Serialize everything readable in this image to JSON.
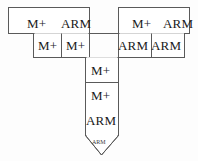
{
  "diagram": {
    "type": "flowchart-arrow",
    "title": "",
    "background_color": "#fdfdfd",
    "stroke_color": "#5a5a5a",
    "fill_color": "#ffffff",
    "text_color": "#1a1a1a",
    "shape_description": "T-shaped / downward-arrow pipeline outline composed of adjoining rectangular cells",
    "rows": [
      {
        "row_index": 0,
        "cells": [
          {
            "id": "r0c0",
            "label": "M+",
            "x": 12,
            "y": 13
          },
          {
            "id": "r0c1",
            "label": "ARM",
            "x": 62,
            "y": 13
          },
          {
            "id": "r0c2",
            "label": "M+",
            "x": 120,
            "y": 13
          },
          {
            "id": "r0c3",
            "label": "ARM",
            "x": 167,
            "y": 13
          }
        ]
      },
      {
        "row_index": 1,
        "cells": [
          {
            "id": "r1c0",
            "label": "M+",
            "x": 44,
            "y": 45
          },
          {
            "id": "r1c1",
            "label": "M+",
            "x": 78,
            "y": 45
          },
          {
            "id": "r1c2",
            "label": "ARM",
            "x": 122,
            "y": 45
          },
          {
            "id": "r1c3",
            "label": "ARM",
            "x": 155,
            "y": 45
          }
        ]
      },
      {
        "row_index": 2,
        "cells": [
          {
            "id": "r2c0",
            "label": "M+",
            "x": 101,
            "y": 70
          }
        ]
      },
      {
        "row_index": 3,
        "cells": [
          {
            "id": "r3c0",
            "label": "M+",
            "x": 101,
            "y": 96
          }
        ]
      },
      {
        "row_index": 4,
        "cells": [
          {
            "id": "r4c0",
            "label": "ARM",
            "x": 101,
            "y": 120
          }
        ]
      },
      {
        "row_index": 5,
        "cells": [
          {
            "id": "r5c0",
            "label": "ARM",
            "x": 101,
            "y": 143,
            "tiny": true
          }
        ]
      }
    ],
    "outline_path": "M 8 7 L 89 7 L 89 34 L 118 34 L 118 7 L 190 7 L 190 33 L 152 33 L 152 57 L 118 57 L 118 137 L 101 154 L 85 137 L 85 57 L 33 57 L 33 33 L 8 33 Z",
    "internal_dividers": [
      {
        "from_x": 85,
        "from_y": 82,
        "to_x": 118,
        "to_y": 82
      },
      {
        "from_x": 89,
        "from_y": 7,
        "to_x": 89,
        "to_y": 34
      },
      {
        "from_x": 118,
        "from_y": 7,
        "to_x": 118,
        "to_y": 34
      },
      {
        "from_x": 33,
        "from_y": 33,
        "to_x": 33,
        "to_y": 57
      },
      {
        "from_x": 152,
        "from_y": 33,
        "to_x": 152,
        "to_y": 57
      },
      {
        "from_x": 85,
        "from_y": 57,
        "to_x": 118,
        "to_y": 57
      },
      {
        "from_x": 8,
        "from_y": 33,
        "to_x": 89,
        "to_y": 33
      },
      {
        "from_x": 118,
        "from_y": 33,
        "to_x": 190,
        "to_y": 33
      },
      {
        "from_x": 119,
        "from_y": 33,
        "to_x": 119,
        "to_y": 57
      }
    ],
    "arrow_tip": {
      "label": "ARM",
      "points": "85,135 118,135 101,155",
      "stroke_color": "#5a5a5a"
    }
  }
}
